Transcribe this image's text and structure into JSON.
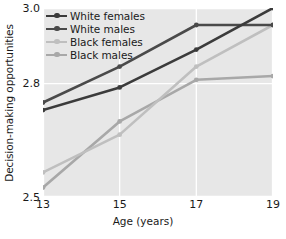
{
  "chart_data": {
    "type": "line",
    "title": "",
    "xlabel": "Age (years)",
    "ylabel": "Decision-making opportunities",
    "x": [
      13,
      15,
      17,
      19
    ],
    "xtick_labels": [
      "13",
      "15",
      "17",
      "19"
    ],
    "ytick_labels": [
      "3.0",
      "2.8",
      "2.5"
    ],
    "ytick_values": [
      3.0,
      2.8,
      2.5
    ],
    "xlim": [
      13,
      19
    ],
    "ylim": [
      2.5,
      3.0
    ],
    "grid": true,
    "grid_color": "#ffffff",
    "plot_background": "#e7e7e7",
    "legend_position": "upper-left",
    "markers": "circle",
    "series": [
      {
        "name": "White females",
        "color": "#3b3b3b",
        "values": [
          2.73,
          2.79,
          2.89,
          3.0
        ]
      },
      {
        "name": "White males",
        "color": "#4a4a4a",
        "values": [
          2.75,
          2.845,
          2.955,
          2.955
        ]
      },
      {
        "name": "Black females",
        "color": "#bfbfbf",
        "values": [
          2.565,
          2.665,
          2.845,
          2.955
        ]
      },
      {
        "name": "Black males",
        "color": "#a8a8a8",
        "values": [
          2.525,
          2.7,
          2.81,
          2.82
        ]
      }
    ]
  }
}
